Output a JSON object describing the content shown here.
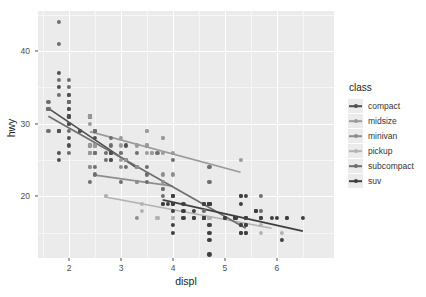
{
  "chart_data": {
    "type": "scatter",
    "title": "",
    "xlabel": "displ",
    "ylabel": "hwy",
    "xlim": [
      1.4,
      7.1
    ],
    "ylim": [
      11.5,
      45.5
    ],
    "xticks": [
      2,
      3,
      4,
      5,
      6
    ],
    "yticks": [
      20,
      30,
      40
    ],
    "xtick_labels": [
      "2",
      "3",
      "4",
      "5",
      "6"
    ],
    "ytick_labels": [
      "20",
      "30",
      "40"
    ],
    "grid": true,
    "legend_position": "right",
    "legend_title": "class",
    "panel_background": "#ebebeb",
    "gridline_color": "#ffffff",
    "series": [
      {
        "name": "compact",
        "color": "#4f4f4f",
        "points": [
          [
            1.8,
            29
          ],
          [
            1.8,
            29
          ],
          [
            2.0,
            31
          ],
          [
            2.0,
            30
          ],
          [
            2.8,
            26
          ],
          [
            2.8,
            26
          ],
          [
            3.1,
            27
          ],
          [
            1.8,
            26
          ],
          [
            1.8,
            25
          ],
          [
            2.0,
            28
          ],
          [
            2.0,
            27
          ],
          [
            2.8,
            25
          ],
          [
            2.8,
            25
          ],
          [
            3.1,
            25
          ],
          [
            3.1,
            25
          ],
          [
            2.4,
            27
          ],
          [
            2.4,
            26
          ],
          [
            2.5,
            26
          ],
          [
            2.5,
            26
          ],
          [
            3.3,
            24
          ],
          [
            2.0,
            33
          ],
          [
            2.0,
            32
          ],
          [
            2.0,
            32
          ],
          [
            2.0,
            31
          ],
          [
            2.8,
            26
          ],
          [
            1.8,
            29
          ],
          [
            1.8,
            29
          ],
          [
            2.0,
            31
          ],
          [
            2.0,
            30
          ],
          [
            2.5,
            29
          ],
          [
            2.5,
            29
          ],
          [
            2.2,
            29
          ],
          [
            2.2,
            29
          ],
          [
            2.4,
            31
          ],
          [
            2.4,
            31
          ],
          [
            1.8,
            37
          ],
          [
            1.8,
            35
          ],
          [
            2.0,
            34
          ],
          [
            2.0,
            34
          ],
          [
            2.0,
            33
          ],
          [
            2.5,
            28
          ],
          [
            2.5,
            27
          ]
        ],
        "trend": [
          [
            1.6,
            32.1
          ],
          [
            3.3,
            23.9
          ]
        ]
      },
      {
        "name": "midsize",
        "color": "#9a9a9a",
        "points": [
          [
            2.4,
            26
          ],
          [
            3.0,
            25
          ],
          [
            3.3,
            27
          ],
          [
            3.5,
            29
          ],
          [
            2.4,
            26
          ],
          [
            2.4,
            24
          ],
          [
            3.1,
            25
          ],
          [
            3.5,
            27
          ],
          [
            3.6,
            26
          ],
          [
            2.4,
            27
          ],
          [
            3.0,
            26
          ],
          [
            3.3,
            24
          ],
          [
            3.5,
            26
          ],
          [
            3.8,
            28
          ],
          [
            3.8,
            26
          ],
          [
            3.8,
            28
          ],
          [
            4.0,
            26
          ],
          [
            2.4,
            31
          ],
          [
            2.4,
            30
          ],
          [
            3.0,
            28
          ],
          [
            3.0,
            27
          ],
          [
            3.5,
            29
          ],
          [
            3.5,
            27
          ],
          [
            5.3,
            25
          ],
          [
            2.5,
            27
          ],
          [
            2.5,
            27
          ],
          [
            2.5,
            26
          ],
          [
            3.6,
            26
          ]
        ],
        "trend": [
          [
            2.4,
            28.9
          ],
          [
            5.3,
            23.3
          ]
        ]
      },
      {
        "name": "minivan",
        "color": "#8e8e8e",
        "points": [
          [
            2.4,
            24
          ],
          [
            3.0,
            24
          ],
          [
            3.3,
            22
          ],
          [
            3.3,
            22
          ],
          [
            3.3,
            24
          ],
          [
            3.3,
            24
          ],
          [
            3.3,
            17
          ],
          [
            3.8,
            22
          ],
          [
            3.8,
            21
          ],
          [
            3.8,
            23
          ],
          [
            4.0,
            23
          ]
        ],
        "trend": [
          [
            2.5,
            22.9
          ],
          [
            4.0,
            21.4
          ]
        ]
      },
      {
        "name": "pickup",
        "color": "#b2b2b2",
        "points": [
          [
            3.7,
            17
          ],
          [
            3.7,
            17
          ],
          [
            4.0,
            17
          ],
          [
            4.0,
            17
          ],
          [
            4.7,
            17
          ],
          [
            4.7,
            16
          ],
          [
            4.7,
            17
          ],
          [
            5.7,
            17
          ],
          [
            5.7,
            18
          ],
          [
            5.7,
            17
          ],
          [
            4.2,
            18
          ],
          [
            4.2,
            17
          ],
          [
            4.6,
            18
          ],
          [
            4.6,
            17
          ],
          [
            4.6,
            17
          ],
          [
            5.4,
            17
          ],
          [
            5.4,
            17
          ],
          [
            2.7,
            20
          ],
          [
            2.7,
            20
          ],
          [
            3.4,
            19
          ],
          [
            3.4,
            18
          ],
          [
            4.0,
            18
          ],
          [
            4.0,
            17
          ],
          [
            4.7,
            17
          ],
          [
            4.7,
            16
          ],
          [
            4.7,
            16
          ],
          [
            5.7,
            16
          ],
          [
            5.7,
            15
          ],
          [
            6.1,
            15
          ],
          [
            4.0,
            18
          ],
          [
            4.2,
            17
          ],
          [
            4.4,
            17
          ]
        ],
        "trend": [
          [
            2.7,
            19.9
          ],
          [
            5.9,
            15.6
          ]
        ]
      },
      {
        "name": "subcompact",
        "color": "#6e6e6e",
        "points": [
          [
            1.8,
            44
          ],
          [
            1.8,
            41
          ],
          [
            2.0,
            29
          ],
          [
            2.0,
            26
          ],
          [
            2.8,
            28
          ],
          [
            2.8,
            27
          ],
          [
            3.1,
            24
          ],
          [
            1.6,
            33
          ],
          [
            1.6,
            32
          ],
          [
            1.6,
            32
          ],
          [
            1.6,
            29
          ],
          [
            1.6,
            32
          ],
          [
            1.8,
            34
          ],
          [
            1.8,
            36
          ],
          [
            2.0,
            36
          ],
          [
            2.5,
            29
          ],
          [
            2.5,
            26
          ],
          [
            3.3,
            26
          ],
          [
            2.0,
            33
          ],
          [
            2.0,
            35
          ],
          [
            2.7,
            26
          ],
          [
            2.7,
            25
          ],
          [
            3.0,
            26
          ],
          [
            3.7,
            26
          ],
          [
            4.0,
            25
          ],
          [
            4.7,
            24
          ],
          [
            4.7,
            22
          ],
          [
            5.7,
            20
          ],
          [
            5.7,
            18
          ],
          [
            2.5,
            23
          ],
          [
            2.5,
            24
          ],
          [
            3.5,
            24
          ],
          [
            3.5,
            23
          ],
          [
            3.8,
            21
          ],
          [
            3.8,
            20
          ],
          [
            4.6,
            19
          ],
          [
            4.6,
            18
          ],
          [
            5.4,
            17
          ],
          [
            5.4,
            17
          ],
          [
            2.4,
            22
          ],
          [
            3.0,
            22
          ],
          [
            3.5,
            22
          ]
        ],
        "trend": [
          [
            1.6,
            31.0
          ],
          [
            5.4,
            15.6
          ]
        ]
      },
      {
        "name": "suv",
        "color": "#3f3f3f",
        "points": [
          [
            4.0,
            20
          ],
          [
            4.7,
            19
          ],
          [
            4.7,
            19
          ],
          [
            4.7,
            19
          ],
          [
            5.2,
            17
          ],
          [
            5.2,
            17
          ],
          [
            3.9,
            19
          ],
          [
            4.7,
            19
          ],
          [
            4.7,
            19
          ],
          [
            5.2,
            17
          ],
          [
            5.7,
            17
          ],
          [
            5.9,
            17
          ],
          [
            4.0,
            20
          ],
          [
            4.0,
            20
          ],
          [
            4.6,
            19
          ],
          [
            5.0,
            17
          ],
          [
            4.2,
            19
          ],
          [
            4.4,
            18
          ],
          [
            4.6,
            19
          ],
          [
            5.4,
            17
          ],
          [
            5.4,
            20
          ],
          [
            4.0,
            19
          ],
          [
            4.0,
            18
          ],
          [
            4.6,
            17
          ],
          [
            5.0,
            17
          ],
          [
            4.2,
            18
          ],
          [
            4.4,
            17
          ],
          [
            4.6,
            17
          ],
          [
            5.4,
            17
          ],
          [
            3.8,
            19
          ],
          [
            3.8,
            19
          ],
          [
            4.0,
            19
          ],
          [
            4.0,
            19
          ],
          [
            4.6,
            17
          ],
          [
            4.6,
            17
          ],
          [
            5.4,
            15
          ],
          [
            5.4,
            15
          ],
          [
            4.7,
            14
          ],
          [
            4.7,
            16
          ],
          [
            6.5,
            17
          ],
          [
            5.3,
            20
          ],
          [
            5.3,
            20
          ],
          [
            5.3,
            19
          ],
          [
            5.7,
            17
          ],
          [
            6.0,
            17
          ],
          [
            5.6,
            18
          ],
          [
            5.6,
            18
          ],
          [
            5.6,
            18
          ],
          [
            6.1,
            14
          ],
          [
            4.0,
            16
          ],
          [
            4.2,
            17
          ],
          [
            4.4,
            17
          ],
          [
            4.6,
            17
          ],
          [
            5.4,
            16
          ],
          [
            5.4,
            16
          ],
          [
            6.2,
            17
          ],
          [
            6.2,
            17
          ],
          [
            5.3,
            16
          ],
          [
            5.3,
            15
          ],
          [
            5.3,
            16
          ],
          [
            4.0,
            15
          ],
          [
            4.7,
            12
          ],
          [
            4.7,
            15
          ],
          [
            5.3,
            15
          ]
        ],
        "trend": [
          [
            3.8,
            19.5
          ],
          [
            6.5,
            15.2
          ]
        ]
      }
    ]
  },
  "legend": {
    "title": "class",
    "items": [
      {
        "label": "compact",
        "color": "#4f4f4f"
      },
      {
        "label": "midsize",
        "color": "#9a9a9a"
      },
      {
        "label": "minivan",
        "color": "#8e8e8e"
      },
      {
        "label": "pickup",
        "color": "#b2b2b2"
      },
      {
        "label": "subcompact",
        "color": "#6e6e6e"
      },
      {
        "label": "suv",
        "color": "#3f3f3f"
      }
    ]
  }
}
